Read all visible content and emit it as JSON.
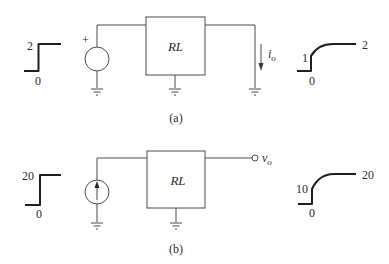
{
  "figure": {
    "circuit_a": {
      "caption": "(a)",
      "input_waveform": {
        "high_label": "2",
        "low_label": "0",
        "type": "step"
      },
      "source": {
        "type": "voltage-source",
        "polarity_label": "+"
      },
      "block_label": "RL",
      "output": {
        "type": "current",
        "label_main": "i",
        "label_sub": "o"
      },
      "output_waveform": {
        "initial_label": "1",
        "zero_label": "0",
        "final_label": "2",
        "type": "step-with-exponential-rise"
      }
    },
    "circuit_b": {
      "caption": "(b)",
      "input_waveform": {
        "high_label": "20",
        "low_label": "0",
        "type": "step"
      },
      "source": {
        "type": "current-source",
        "arrow_direction": "up"
      },
      "block_label": "RL",
      "output": {
        "type": "voltage",
        "label_main": "v",
        "label_sub": "o"
      },
      "output_waveform": {
        "initial_label": "10",
        "zero_label": "0",
        "final_label": "20",
        "type": "step-with-exponential-rise"
      }
    }
  },
  "colors": {
    "wire": "#4a4a4a",
    "waveform": "#1e1e1e",
    "text": "#2a2a2a",
    "background": "#ffffff"
  }
}
